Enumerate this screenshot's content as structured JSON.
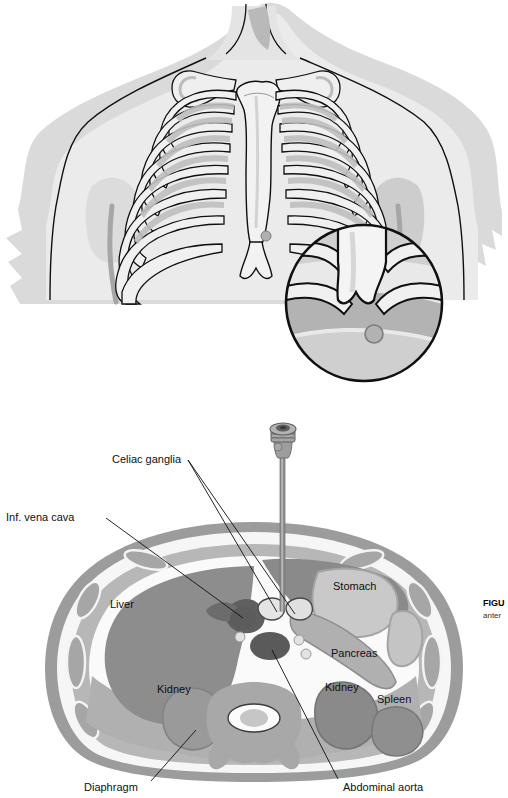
{
  "figure": {
    "domain": "medical-illustration",
    "title_visible": "FIGU",
    "caption_visible": "anter",
    "caption_truncated": true
  },
  "panels": {
    "top": {
      "name": "anterior-thorax-surface-landmarks",
      "description": "Anterior view of the chest showing clavicles, sternum, xiphoid process and rib cage with soft tissue outline",
      "inset": {
        "name": "xiphoid-magnification-inset",
        "marker_label": "needle-insertion-point"
      }
    },
    "bottom": {
      "name": "axial-cross-section-celiac-level",
      "description": "Transverse abdominal cross section at the celiac plexus level with needle in place"
    }
  },
  "labels": {
    "celiac_ganglia": "Celiac ganglia",
    "inf_vena_cava": "Inf. vena cava",
    "liver": "Liver",
    "stomach": "Stomach",
    "pancreas": "Pancreas",
    "kidney_left": "Kidney",
    "kidney_right": "Kidney",
    "spleen": "Spleen",
    "diaphragm": "Diaphragm",
    "abdominal_aorta": "Abdominal aorta"
  },
  "colors": {
    "outline": "#101010",
    "skin_rim": "#9a9a9a",
    "muscle": "#b5b5b5",
    "fat": "#f4f4f4",
    "liver": "#8d8d8d",
    "organ_mid": "#a8a8a8",
    "organ_light": "#c9c9c9",
    "vessel_dark": "#6a6a6a",
    "aorta": "#5e5e5e",
    "bone_light": "#e8e8e8",
    "shadow": "#cfcfcf",
    "needle": "#8e8e8e",
    "background": "#ffffff"
  }
}
